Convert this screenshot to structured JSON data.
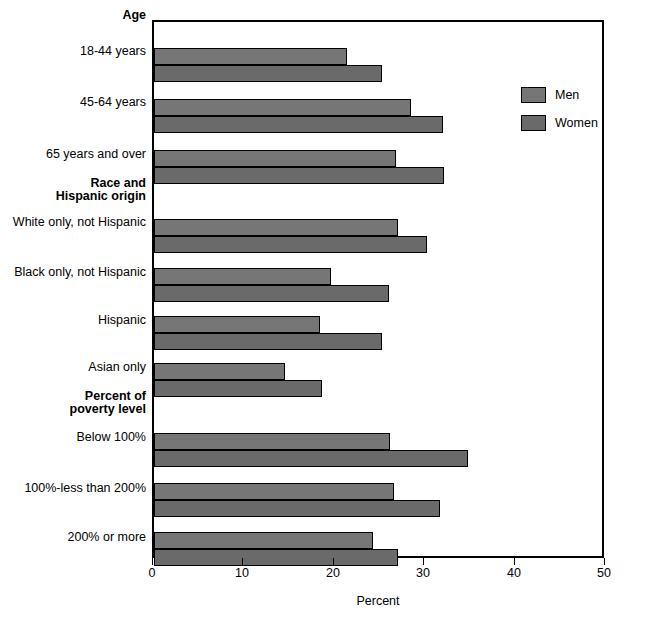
{
  "chart_data": {
    "type": "bar",
    "orientation": "horizontal",
    "title": "",
    "xlabel": "Percent",
    "ylabel": "",
    "xlim": [
      0,
      50
    ],
    "xticks": [
      0,
      10,
      20,
      30,
      40,
      50
    ],
    "xticklabels": [
      "0",
      "10",
      "20",
      "30",
      "40",
      "50"
    ],
    "grid": false,
    "legend_position": "upper right",
    "legend": [
      "Men",
      "Women"
    ],
    "series": [
      {
        "name": "Men",
        "color": "#767676",
        "values": [
          21.5,
          28.7,
          27.0,
          27.2,
          19.7,
          18.5,
          14.6,
          26.3,
          26.8,
          24.4
        ]
      },
      {
        "name": "Women",
        "color": "#6a6a6a",
        "values": [
          25.4,
          32.2,
          32.4,
          30.5,
          26.2,
          25.5,
          18.8,
          35.0,
          31.9,
          27.2
        ]
      }
    ],
    "categories": [
      "18-44 years",
      "45-64 years",
      "65 years and over",
      "White only, not Hispanic",
      "Black only, not Hispanic",
      "Hispanic",
      "Asian only",
      "Below 100%",
      "100%-less than 200%",
      "200% or more"
    ],
    "category_headers": [
      {
        "label": "Age",
        "before_category": "18-44 years"
      },
      {
        "label": "Race and\nHispanic origin",
        "before_category": "White only, not Hispanic"
      },
      {
        "label": "Percent of\npoverty level",
        "before_category": "Below 100%"
      }
    ],
    "groups": [
      {
        "header": "Age",
        "header_lines": [
          "Age"
        ],
        "rows": [
          {
            "label": "18-44 years",
            "men": 21.5,
            "women": 25.4
          },
          {
            "label": "45-64 years",
            "men": 28.7,
            "women": 32.2
          },
          {
            "label": "65 years and over",
            "men": 27.0,
            "women": 32.4
          }
        ]
      },
      {
        "header": "Race and Hispanic origin",
        "header_lines": [
          "Race and",
          "Hispanic origin"
        ],
        "rows": [
          {
            "label": "White only, not Hispanic",
            "men": 27.2,
            "women": 30.5
          },
          {
            "label": "Black only, not Hispanic",
            "men": 19.7,
            "women": 26.2
          },
          {
            "label": "Hispanic",
            "men": 18.5,
            "women": 25.5
          },
          {
            "label": "Asian only",
            "men": 14.6,
            "women": 18.8
          }
        ]
      },
      {
        "header": "Percent of poverty level",
        "header_lines": [
          "Percent of",
          "poverty level"
        ],
        "rows": [
          {
            "label": "Below 100%",
            "men": 26.3,
            "women": 35.0
          },
          {
            "label": "100%-less than 200%",
            "men": 26.8,
            "women": 31.9
          },
          {
            "label": "200% or more",
            "men": 24.4,
            "women": 27.2
          }
        ]
      }
    ]
  },
  "axis": {
    "x_label": "Percent",
    "tick_0": "0",
    "tick_1": "10",
    "tick_2": "20",
    "tick_3": "30",
    "tick_4": "40",
    "tick_5": "50"
  },
  "legend": {
    "men_label": "Men",
    "women_label": "Women"
  },
  "labels": {
    "head_age": "Age",
    "age_1": "18-44 years",
    "age_2": "45-64 years",
    "age_3": "65 years and over",
    "head_race_1": "Race and",
    "head_race_2": "Hispanic origin",
    "race_1": "White only, not Hispanic",
    "race_2": "Black only, not Hispanic",
    "race_3": "Hispanic",
    "race_4": "Asian only",
    "head_pov_1": "Percent of",
    "head_pov_2": "poverty level",
    "pov_1": "Below 100%",
    "pov_2": "100%-less than 200%",
    "pov_3": "200% or more"
  },
  "colors": {
    "men": "#767676",
    "women": "#6a6a6a",
    "axis": "#000000",
    "background": "#ffffff"
  }
}
